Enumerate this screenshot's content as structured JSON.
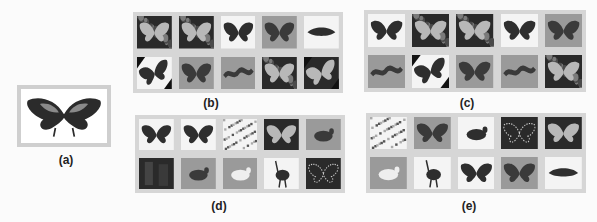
{
  "figure": {
    "query": {
      "label": "(a)",
      "subject": "butterfly",
      "bg": "light"
    },
    "panels": [
      {
        "id": "b",
        "label": "(b)",
        "thumbs": [
          {
            "subject": "butterfly-flowers",
            "bg": "dark"
          },
          {
            "subject": "butterfly-foliage",
            "bg": "dark"
          },
          {
            "subject": "butterfly",
            "bg": "light"
          },
          {
            "subject": "butterfly-closeup",
            "bg": "mid"
          },
          {
            "subject": "moth",
            "bg": "light"
          },
          {
            "subject": "butterfly-rotated",
            "bg": "light"
          },
          {
            "subject": "butterfly",
            "bg": "mid"
          },
          {
            "subject": "caterpillar",
            "bg": "mid"
          },
          {
            "subject": "butterfly-on-leaf",
            "bg": "dark"
          },
          {
            "subject": "butterfly-rotated",
            "bg": "dark"
          }
        ]
      },
      {
        "id": "c",
        "label": "(c)",
        "thumbs": [
          {
            "subject": "butterfly",
            "bg": "light"
          },
          {
            "subject": "butterfly-flowers",
            "bg": "dark"
          },
          {
            "subject": "butterfly-foliage",
            "bg": "dark"
          },
          {
            "subject": "butterfly",
            "bg": "light"
          },
          {
            "subject": "butterfly-closeup",
            "bg": "mid"
          },
          {
            "subject": "caterpillar",
            "bg": "mid"
          },
          {
            "subject": "butterfly-rotated",
            "bg": "light"
          },
          {
            "subject": "butterfly",
            "bg": "mid"
          },
          {
            "subject": "caterpillar",
            "bg": "mid"
          },
          {
            "subject": "butterfly-on-leaf",
            "bg": "dark"
          }
        ]
      },
      {
        "id": "d",
        "label": "(d)",
        "thumbs": [
          {
            "subject": "butterfly",
            "bg": "light"
          },
          {
            "subject": "butterfly",
            "bg": "light"
          },
          {
            "subject": "texture-noise",
            "bg": "light"
          },
          {
            "subject": "butterfly-on-hand",
            "bg": "dark"
          },
          {
            "subject": "bird-pigeon",
            "bg": "mid"
          },
          {
            "subject": "dark-scene",
            "bg": "dark"
          },
          {
            "subject": "bird-in-grass",
            "bg": "mid"
          },
          {
            "subject": "bird-dove",
            "bg": "mid"
          },
          {
            "subject": "bird-emu",
            "bg": "light"
          },
          {
            "subject": "butterfly-outline",
            "bg": "dark"
          }
        ]
      },
      {
        "id": "e",
        "label": "(e)",
        "thumbs": [
          {
            "subject": "texture-noise",
            "bg": "light"
          },
          {
            "subject": "butterfly-on-hand",
            "bg": "mid"
          },
          {
            "subject": "bird-pigeon",
            "bg": "light"
          },
          {
            "subject": "butterfly-outline",
            "bg": "dark"
          },
          {
            "subject": "butterfly-dark",
            "bg": "dark"
          },
          {
            "subject": "bird-dove",
            "bg": "mid"
          },
          {
            "subject": "bird-emu",
            "bg": "light"
          },
          {
            "subject": "butterfly",
            "bg": "light"
          },
          {
            "subject": "butterfly-closeup",
            "bg": "mid"
          },
          {
            "subject": "moth",
            "bg": "light"
          }
        ]
      }
    ]
  }
}
